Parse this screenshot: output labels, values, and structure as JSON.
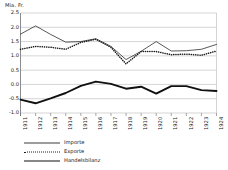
{
  "chart_data": {
    "type": "line",
    "title": "",
    "xlabel": "",
    "ylabel": "Mia. Fr.",
    "unit_label": "Mia. Fr.",
    "categories": [
      "1911",
      "1912",
      "1913",
      "1914",
      "1915",
      "1916",
      "1917",
      "1918",
      "1919",
      "1920",
      "1921",
      "1922",
      "1923",
      "1924"
    ],
    "ylim": [
      -1.0,
      2.5
    ],
    "yticks": [
      "2.5",
      "2.0",
      "1.5",
      "1.0",
      "0.5",
      "0.0",
      "-0.5",
      "-1.0"
    ],
    "ytick_values": [
      2.5,
      2.0,
      1.5,
      1.0,
      0.5,
      0.0,
      -0.5,
      -1.0
    ],
    "grid": true,
    "legend_position": "bottom-left",
    "series": [
      {
        "name": "Importe",
        "style": "solid-thin",
        "color": "#3a3a3a",
        "values": [
          1.76,
          2.05,
          1.75,
          1.48,
          1.5,
          1.6,
          1.33,
          0.87,
          1.16,
          1.5,
          1.17,
          1.18,
          1.23,
          1.4
        ]
      },
      {
        "name": "Exporte",
        "style": "dotted",
        "color": "#1a1a1a",
        "values": [
          1.23,
          1.33,
          1.3,
          1.23,
          1.47,
          1.58,
          1.3,
          0.72,
          1.15,
          1.15,
          1.04,
          1.06,
          1.02,
          1.17
        ]
      },
      {
        "name": "Handelsbilanz",
        "style": "solid-thick",
        "color": "#111111",
        "values": [
          -0.53,
          -0.66,
          -0.49,
          -0.3,
          -0.05,
          0.1,
          0.02,
          -0.15,
          -0.08,
          -0.32,
          -0.06,
          -0.06,
          -0.2,
          -0.23
        ]
      }
    ]
  },
  "legend": {
    "items": [
      {
        "label": "Importe"
      },
      {
        "label": "Exporte"
      },
      {
        "label": "Handelsbilanz"
      }
    ]
  }
}
